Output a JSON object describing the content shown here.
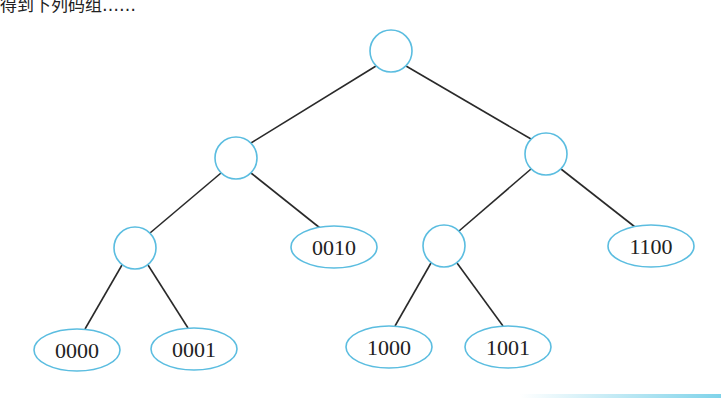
{
  "caption": {
    "text": "得到下列码组……",
    "note": "partially cropped line at top"
  },
  "tree": {
    "internal_nodes": [
      {
        "id": "root",
        "cx": 391,
        "cy": 51,
        "r": 21
      },
      {
        "id": "L",
        "cx": 236,
        "cy": 158,
        "r": 21
      },
      {
        "id": "R",
        "cx": 546,
        "cy": 154,
        "r": 21
      },
      {
        "id": "LL",
        "cx": 135,
        "cy": 248,
        "r": 21
      },
      {
        "id": "RL",
        "cx": 444,
        "cy": 246,
        "r": 21
      }
    ],
    "leaves": [
      {
        "id": "leaf_0010",
        "label": "0010",
        "cx": 334,
        "cy": 247
      },
      {
        "id": "leaf_1100",
        "label": "1100",
        "cx": 651,
        "cy": 246
      },
      {
        "id": "leaf_0000",
        "label": "0000",
        "cx": 77,
        "cy": 350
      },
      {
        "id": "leaf_0001",
        "label": "0001",
        "cx": 194,
        "cy": 349
      },
      {
        "id": "leaf_1000",
        "label": "1000",
        "cx": 389,
        "cy": 347
      },
      {
        "id": "leaf_1001",
        "label": "1001",
        "cx": 508,
        "cy": 347
      }
    ],
    "edges": [
      [
        "root",
        "L"
      ],
      [
        "root",
        "R"
      ],
      [
        "L",
        "LL"
      ],
      [
        "L",
        "leaf_0010"
      ],
      [
        "R",
        "RL"
      ],
      [
        "R",
        "leaf_1100"
      ],
      [
        "LL",
        "leaf_0000"
      ],
      [
        "LL",
        "leaf_0001"
      ],
      [
        "RL",
        "leaf_1000"
      ],
      [
        "RL",
        "leaf_1001"
      ]
    ],
    "colors": {
      "node_stroke": "#5bbde0",
      "edge": "#2a2a2a",
      "text": "#222222"
    }
  }
}
